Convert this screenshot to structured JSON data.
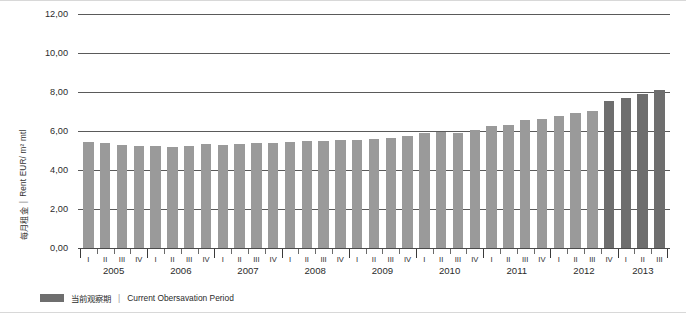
{
  "chart_data": {
    "type": "bar",
    "title": "",
    "subtitle": "",
    "xlabel": "",
    "ylabel": "每月租金 | Rent  EUR/ m² mtl",
    "ylabel_zh": "每月租金",
    "ylabel_en": "Rent  EUR/ m² mtl",
    "ylabel_separator": "|",
    "ylim": [
      0,
      12
    ],
    "ytick_labels": [
      "0,00",
      "2,00",
      "4,00",
      "6,00",
      "8,00",
      "10,00",
      "12,00"
    ],
    "ytick_values": [
      0,
      2,
      4,
      6,
      8,
      10,
      12
    ],
    "grid": true,
    "grid_axis": "y",
    "legend_position": "bottom-left",
    "categories": [
      "2005 I",
      "2005 II",
      "2005 III",
      "2005 IV",
      "2006 I",
      "2006 II",
      "2006 III",
      "2006 IV",
      "2007 I",
      "2007 II",
      "2007 III",
      "2007 IV",
      "2008 I",
      "2008 II",
      "2008 III",
      "2008 IV",
      "2009 I",
      "2009 II",
      "2009 III",
      "2009 IV",
      "2010 I",
      "2010 II",
      "2010 III",
      "2010 IV",
      "2011 I",
      "2011 II",
      "2011 III",
      "2011 IV",
      "2012 I",
      "2012 II",
      "2012 III",
      "2012 IV",
      "2013 I",
      "2013 II",
      "2013 III"
    ],
    "quarter_labels": [
      "I",
      "II",
      "III",
      "IV",
      "I",
      "II",
      "III",
      "IV",
      "I",
      "II",
      "III",
      "IV",
      "I",
      "II",
      "III",
      "IV",
      "I",
      "II",
      "III",
      "IV",
      "I",
      "II",
      "III",
      "IV",
      "I",
      "II",
      "III",
      "IV",
      "I",
      "II",
      "III",
      "IV",
      "I",
      "II",
      "III"
    ],
    "years": [
      {
        "label": "2005",
        "quarters": 4
      },
      {
        "label": "2006",
        "quarters": 4
      },
      {
        "label": "2007",
        "quarters": 4
      },
      {
        "label": "2008",
        "quarters": 4
      },
      {
        "label": "2009",
        "quarters": 4
      },
      {
        "label": "2010",
        "quarters": 4
      },
      {
        "label": "2011",
        "quarters": 4
      },
      {
        "label": "2012",
        "quarters": 4
      },
      {
        "label": "2013",
        "quarters": 3
      }
    ],
    "values": [
      5.45,
      5.4,
      5.3,
      5.25,
      5.25,
      5.2,
      5.25,
      5.35,
      5.3,
      5.35,
      5.4,
      5.4,
      5.45,
      5.5,
      5.5,
      5.55,
      5.55,
      5.6,
      5.65,
      5.75,
      5.9,
      5.95,
      5.9,
      6.05,
      6.25,
      6.3,
      6.55,
      6.6,
      6.75,
      6.9,
      7.05,
      7.55,
      7.7,
      7.9,
      8.1
    ],
    "highlight_from_index": 31,
    "highlight_indices": [
      31,
      32,
      33,
      34
    ],
    "colors": {
      "bar": "#9a9a9a",
      "bar_highlight": "#6e6e6e",
      "grid": "#5a5a5a",
      "axis": "#4a4a4a",
      "text": "#2b2b2b"
    },
    "legend": [
      {
        "label_zh": "当前观察期",
        "separator": "|",
        "label_en": "Current Obersavation Period",
        "color": "#6e6e6e"
      }
    ]
  }
}
